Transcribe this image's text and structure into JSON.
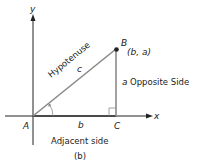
{
  "diagram": {
    "caption": "(b)",
    "axes": {
      "x_label": "x",
      "y_label": "y"
    },
    "points": {
      "A": {
        "label": "A"
      },
      "B": {
        "label": "B",
        "coords": "(b, a)"
      },
      "C": {
        "label": "C"
      }
    },
    "sides": {
      "hypotenuse": {
        "name": "Hypotenuse",
        "symbol": "c"
      },
      "opposite": {
        "name": "Opposite Side",
        "symbol": "a"
      },
      "adjacent": {
        "name": "Adjacent side",
        "symbol": "b"
      }
    },
    "colors": {
      "axis": "#222222",
      "triangle": "#8a8a8a",
      "point": "#222222",
      "text": "#222222"
    }
  }
}
